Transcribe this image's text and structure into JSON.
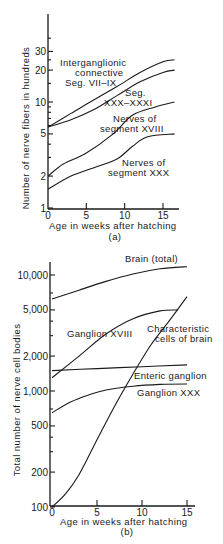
{
  "chart_data": [
    {
      "type": "line",
      "panel": "(a)",
      "title": "",
      "xlabel": "Age in weeks after hatching",
      "ylabel": "Number of nerve fibers in hundreds",
      "yscale": "log",
      "xlim": [
        0,
        17
      ],
      "ylim": [
        1,
        40
      ],
      "xticks": [
        0,
        5,
        10,
        15
      ],
      "xtick_labels": [
        "0",
        "5",
        "10",
        "15"
      ],
      "yticks": [
        1,
        2,
        5,
        10,
        20,
        30
      ],
      "ytick_labels": [
        "1",
        "2",
        "5",
        "10",
        "20",
        "30"
      ],
      "grid": false,
      "legend": "inline labels",
      "series": [
        {
          "name": "Interganglionic connective Seg. VII–IX",
          "x": [
            0,
            3,
            6,
            9,
            12,
            15,
            16.5
          ],
          "values": [
            5.8,
            7.8,
            10.5,
            14,
            19,
            24,
            25
          ]
        },
        {
          "name": "Seg. XXX–XXXI",
          "x": [
            0,
            3,
            6,
            9,
            12,
            15,
            16.5
          ],
          "values": [
            5.8,
            6.8,
            8.5,
            11.5,
            15.5,
            19,
            20
          ]
        },
        {
          "name": "Nerves of segment XVIII",
          "x": [
            0,
            2,
            5,
            8.5,
            11,
            14,
            16.5
          ],
          "values": [
            2,
            2.6,
            3.3,
            5,
            7.5,
            9,
            10
          ]
        },
        {
          "name": "Nerves of segment XXX",
          "x": [
            0,
            3,
            6,
            9,
            11,
            13,
            16.5
          ],
          "values": [
            1.5,
            2,
            2.4,
            2.9,
            3.8,
            4.7,
            5
          ]
        }
      ],
      "caption": "(a)"
    },
    {
      "type": "line",
      "panel": "(b)",
      "title": "",
      "xlabel": "Age in weeks after hatching",
      "ylabel": "Total number of nerve cell bodies",
      "yscale": "log",
      "xlim": [
        0,
        16
      ],
      "ylim": [
        100,
        14000
      ],
      "xticks": [
        0,
        5,
        10,
        15
      ],
      "xtick_labels": [
        "0",
        "5",
        "10",
        "15"
      ],
      "yticks": [
        100,
        200,
        500,
        1000,
        2000,
        5000,
        10000
      ],
      "ytick_labels": [
        "100",
        "200",
        "500",
        "1,000",
        "2,000",
        "5,000",
        "10,000"
      ],
      "grid": false,
      "legend": "inline labels",
      "series": [
        {
          "name": "Brain (total)",
          "x": [
            0,
            3,
            6,
            9,
            12,
            15
          ],
          "values": [
            6200,
            7400,
            8800,
            10200,
            11300,
            11800
          ]
        },
        {
          "name": "Ganglion XVIII",
          "x": [
            0,
            3,
            6,
            9,
            12,
            14
          ],
          "values": [
            1300,
            2000,
            3100,
            4200,
            4900,
            5000
          ]
        },
        {
          "name": "Characteristic cells of brain",
          "x": [
            0,
            1.5,
            3,
            5,
            7,
            9,
            11,
            13,
            15
          ],
          "values": [
            100,
            130,
            190,
            380,
            750,
            1400,
            2500,
            4000,
            6500
          ]
        },
        {
          "name": "Enteric ganglion",
          "x": [
            0,
            5,
            10,
            15
          ],
          "values": [
            1500,
            1560,
            1620,
            1680
          ]
        },
        {
          "name": "Ganglion XXX",
          "x": [
            0,
            2,
            4,
            6,
            9,
            12,
            15
          ],
          "values": [
            650,
            800,
            920,
            1020,
            1100,
            1140,
            1150
          ]
        }
      ],
      "caption": "(b)"
    }
  ],
  "panel_a": {
    "ylabel": "Number of nerve fibers in hundreds",
    "xlabel": "Age in weeks after hatching",
    "caption": "(a)",
    "labels": {
      "interganglionic_1": "Interganglionic",
      "interganglionic_2": "connective",
      "interganglionic_3": "Seg. VII–IX",
      "seg_xxx_1": "Seg.",
      "seg_xxx_2": "XXX–XXXI",
      "xviii_1": "Nerves of",
      "xviii_2": "segment XVIII",
      "xxx_1": "Nerves of",
      "xxx_2": "segment XXX"
    }
  },
  "panel_b": {
    "ylabel": "Total number of nerve cell bodies",
    "xlabel": "Age in weeks after hatching",
    "caption": "(b)",
    "labels": {
      "brain": "Brain (total)",
      "ganglion_xviii": "Ganglion XVIII",
      "char_1": "Characteristic",
      "char_2": "cells of brain",
      "enteric": "Enteric ganglion",
      "ganglion_xxx": "Ganglion XXX"
    }
  }
}
